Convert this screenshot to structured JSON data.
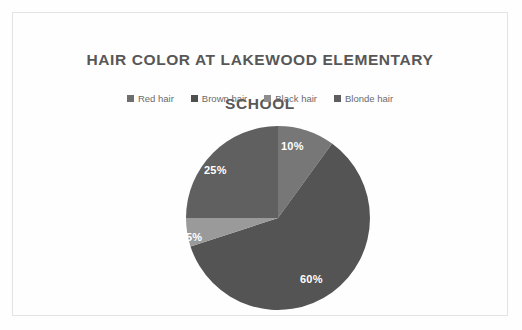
{
  "chart": {
    "title": "HAIR COLOR AT LAKEWOOD ELEMENTARY\nSCHOOL",
    "title_line1": "HAIR COLOR AT LAKEWOOD ELEMENTARY",
    "title_line2": "SCHOOL",
    "background_color": "#fefefe",
    "frame_color": "#e3e3e3",
    "title_color": "#575757",
    "legend_text_color": "#6a6a6a",
    "label_color": "#ffffff"
  },
  "legend": {
    "position": "top",
    "items": [
      {
        "label": "Red hair",
        "color": "#6e6e6e",
        "swatch_icon": "square-marker-icon"
      },
      {
        "label": "Brown hair",
        "color": "#4f4f4f",
        "swatch_icon": "square-marker-icon"
      },
      {
        "label": "Black hair",
        "color": "#8d8d8d",
        "swatch_icon": "square-marker-icon"
      },
      {
        "label": "Blonde hair",
        "color": "#5e5e5e",
        "swatch_icon": "square-marker-icon"
      }
    ]
  },
  "chart_data": {
    "type": "pie",
    "title": "HAIR COLOR AT LAKEWOOD ELEMENTARY SCHOOL",
    "xlabel": "",
    "ylabel": "",
    "legend_position": "top",
    "grid": false,
    "start_angle_deg": 0,
    "direction": "clockwise",
    "categories": [
      "Red hair",
      "Brown hair",
      "Black hair",
      "Blonde hair"
    ],
    "values": [
      10,
      60,
      5,
      25
    ],
    "value_unit": "%",
    "data_labels": [
      "10%",
      "60%",
      "5%",
      "25%"
    ],
    "slice_colors": [
      "#777777",
      "#545454",
      "#9a9a9a",
      "#606060"
    ],
    "slices": [
      {
        "name": "Red hair",
        "value": 10,
        "label": "10%",
        "color": "#777777",
        "start_deg": 0,
        "end_deg": 36
      },
      {
        "name": "Brown hair",
        "value": 60,
        "label": "60%",
        "color": "#545454",
        "start_deg": 36,
        "end_deg": 252
      },
      {
        "name": "Black hair",
        "value": 5,
        "label": "5%",
        "color": "#9a9a9a",
        "start_deg": 252,
        "end_deg": 270
      },
      {
        "name": "Blonde hair",
        "value": 25,
        "label": "25%",
        "color": "#606060",
        "start_deg": 270,
        "end_deg": 360
      }
    ]
  }
}
